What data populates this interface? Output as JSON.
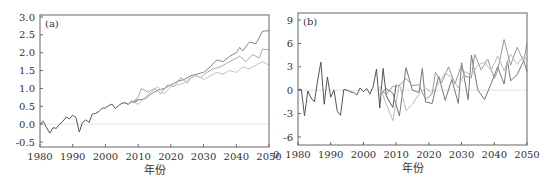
{
  "chart_data": [
    {
      "type": "line",
      "panel_label": "(a)",
      "xlabel": "年份",
      "ylabel": "",
      "xlim": [
        1980,
        2050
      ],
      "ylim": [
        -0.6,
        3.0
      ],
      "x_ticks": [
        1980,
        1990,
        2000,
        2010,
        2020,
        2030,
        2040,
        2050
      ],
      "y_ticks": [
        -0.5,
        0.0,
        0.5,
        1.0,
        1.5,
        2.0,
        2.5,
        3.0
      ],
      "y_tick_labels": [
        "-0.5",
        "0.0",
        "0.5",
        "1.0",
        "1.5",
        "2.0",
        "2.5",
        "3.0"
      ],
      "reference_line": 0,
      "grid": false,
      "legend": null,
      "series": [
        {
          "name": "observed",
          "color": "#555555",
          "x": [
            1980,
            1981,
            1982,
            1983,
            1984,
            1985,
            1986,
            1987,
            1988,
            1989,
            1990,
            1991,
            1992,
            1993,
            1994,
            1995,
            1996,
            1997,
            1998,
            1999,
            2000,
            2001,
            2002,
            2003,
            2004,
            2005,
            2006,
            2007,
            2008,
            2009,
            2010
          ],
          "y": [
            0.0,
            0.08,
            -0.1,
            -0.25,
            -0.1,
            -0.12,
            0.0,
            0.08,
            0.2,
            0.15,
            0.25,
            0.18,
            -0.22,
            0.05,
            0.12,
            0.05,
            0.28,
            0.3,
            0.35,
            0.45,
            0.45,
            0.52,
            0.56,
            0.44,
            0.52,
            0.58,
            0.6,
            0.55,
            0.65,
            0.6,
            0.7
          ]
        },
        {
          "name": "scenario-high",
          "color": "#888888",
          "x": [
            2008,
            2010,
            2012,
            2014,
            2016,
            2018,
            2020,
            2022,
            2024,
            2026,
            2028,
            2030,
            2032,
            2034,
            2036,
            2038,
            2040,
            2041,
            2042,
            2044,
            2046,
            2048,
            2050
          ],
          "y": [
            0.6,
            0.68,
            0.7,
            0.85,
            0.95,
            1.0,
            1.1,
            1.2,
            1.25,
            1.35,
            1.4,
            1.45,
            1.6,
            1.8,
            1.75,
            1.9,
            2.0,
            2.15,
            2.05,
            2.3,
            2.25,
            2.6,
            2.62
          ]
        },
        {
          "name": "scenario-mid",
          "color": "#aaaaaa",
          "x": [
            2008,
            2010,
            2011,
            2013,
            2015,
            2017,
            2019,
            2021,
            2023,
            2025,
            2027,
            2029,
            2031,
            2033,
            2035,
            2037,
            2039,
            2041,
            2043,
            2045,
            2047,
            2048,
            2050
          ],
          "y": [
            0.6,
            0.75,
            1.0,
            0.9,
            1.0,
            0.85,
            1.1,
            1.05,
            1.3,
            1.15,
            1.4,
            1.3,
            1.45,
            1.55,
            1.6,
            1.7,
            1.8,
            1.9,
            1.75,
            1.95,
            1.85,
            2.1,
            2.08
          ]
        },
        {
          "name": "scenario-low",
          "color": "#c4c4c4",
          "x": [
            2008,
            2010,
            2012,
            2014,
            2016,
            2018,
            2020,
            2022,
            2024,
            2026,
            2028,
            2030,
            2032,
            2034,
            2036,
            2038,
            2040,
            2042,
            2044,
            2046,
            2048,
            2050
          ],
          "y": [
            0.65,
            0.55,
            0.75,
            0.9,
            1.05,
            0.85,
            1.05,
            1.1,
            1.15,
            1.3,
            1.35,
            1.25,
            1.35,
            1.45,
            1.4,
            1.5,
            1.45,
            1.6,
            1.55,
            1.65,
            1.75,
            1.65
          ]
        }
      ]
    },
    {
      "type": "line",
      "panel_label": "(b)",
      "xlabel": "年份",
      "ylabel": "",
      "xlim": [
        1980,
        2050
      ],
      "ylim": [
        -7,
        10
      ],
      "x_ticks": [
        1980,
        1990,
        2000,
        2010,
        2020,
        2030,
        2040,
        2050
      ],
      "y_ticks": [
        -6,
        -3,
        0,
        3,
        6,
        9
      ],
      "y_tick_labels": [
        "-6",
        "-3",
        "0",
        "3",
        "6",
        "9"
      ],
      "reference_line": 0,
      "grid": false,
      "legend": null,
      "series": [
        {
          "name": "observed",
          "color": "#555555",
          "x": [
            1980,
            1981,
            1982,
            1983,
            1984,
            1985,
            1986,
            1987,
            1988,
            1989,
            1990,
            1991,
            1992,
            1993,
            1994,
            1995,
            1996,
            1997,
            1998,
            1999,
            2000,
            2001,
            2002,
            2003,
            2004,
            2005,
            2006,
            2007,
            2008,
            2009,
            2010
          ],
          "y": [
            0.1,
            0.1,
            -3.3,
            -0.1,
            -1.0,
            -1.5,
            1.2,
            3.6,
            -1.8,
            1.7,
            -0.9,
            0.0,
            -2.7,
            -3.2,
            0.1,
            0.0,
            -0.2,
            -0.3,
            -0.6,
            0.3,
            -0.2,
            0.2,
            -0.5,
            0.5,
            2.7,
            -2.3,
            2.8,
            -0.7,
            -1.5,
            -2.2,
            0.7
          ]
        },
        {
          "name": "scenario-1",
          "color": "#777777",
          "x": [
            2005,
            2007,
            2009,
            2011,
            2013,
            2015,
            2017,
            2018,
            2019,
            2021,
            2023,
            2025,
            2027,
            2029,
            2030,
            2032,
            2033,
            2035,
            2037,
            2039,
            2041,
            2043,
            2044,
            2045,
            2047,
            2049,
            2050
          ],
          "y": [
            -0.5,
            0.2,
            -0.4,
            -3.3,
            2.9,
            0.0,
            -0.3,
            2.8,
            -1.5,
            -1.7,
            1.8,
            -1.3,
            1.4,
            -1.7,
            3.5,
            -1.2,
            4.5,
            0.0,
            -1.2,
            0.8,
            3.0,
            0.8,
            3.8,
            1.2,
            2.0,
            3.8,
            2.4
          ]
        },
        {
          "name": "scenario-2",
          "color": "#999999",
          "x": [
            2005,
            2007,
            2009,
            2011,
            2013,
            2015,
            2017,
            2019,
            2021,
            2022,
            2024,
            2026,
            2028,
            2030,
            2031,
            2033,
            2034,
            2036,
            2038,
            2040,
            2041,
            2043,
            2045,
            2047,
            2049,
            2050
          ],
          "y": [
            0.0,
            -0.5,
            0.5,
            0.6,
            1.5,
            0.6,
            0.7,
            -1.2,
            -0.5,
            2.3,
            1.0,
            3.0,
            0.8,
            3.3,
            1.8,
            1.6,
            4.6,
            2.6,
            4.0,
            1.5,
            2.5,
            6.5,
            3.2,
            5.5,
            3.7,
            6.0
          ]
        },
        {
          "name": "scenario-3",
          "color": "#bbbbbb",
          "x": [
            2005,
            2007,
            2009,
            2011,
            2013,
            2015,
            2017,
            2019,
            2021,
            2023,
            2025,
            2027,
            2029,
            2031,
            2033,
            2035,
            2037,
            2039,
            2041,
            2043,
            2045,
            2047,
            2049,
            2050
          ],
          "y": [
            0.5,
            -1.8,
            -3.9,
            0.8,
            -2.6,
            -1.8,
            -0.5,
            0.3,
            -0.4,
            0.9,
            2.2,
            1.6,
            0.3,
            2.4,
            1.9,
            3.2,
            3.6,
            2.5,
            4.4,
            2.5,
            4.6,
            3.3,
            4.4,
            3.9
          ]
        }
      ]
    }
  ],
  "panels": {
    "a": {
      "label": "(a)",
      "xlabel": "年份"
    },
    "b": {
      "label": "(b)",
      "xlabel": "年份",
      "clipped_left_tick": "0"
    }
  }
}
